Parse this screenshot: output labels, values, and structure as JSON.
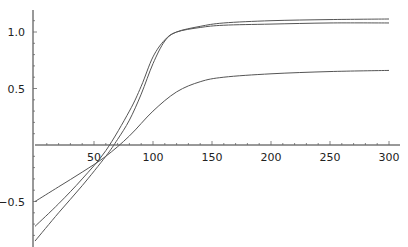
{
  "chart_data": {
    "type": "line",
    "title": "",
    "xlabel": "",
    "ylabel": "",
    "xlim": [
      0,
      300
    ],
    "ylim": [
      -0.88,
      1.18
    ],
    "grid": false,
    "legend": null,
    "x_ticks": [
      50,
      100,
      150,
      200,
      250,
      300
    ],
    "x_tick_labels": [
      "50",
      "100",
      "150",
      "200",
      "250",
      "300"
    ],
    "y_ticks": [
      -0.5,
      0.5,
      1.0
    ],
    "y_tick_labels": [
      "-0.5",
      "0.5",
      "1.0"
    ],
    "series": [
      {
        "name": "curve-1",
        "color": "#555555",
        "x": [
          0,
          20,
          40,
          60,
          80,
          90,
          100,
          110,
          120,
          140,
          160,
          200,
          250,
          300
        ],
        "y": [
          -0.72,
          -0.52,
          -0.3,
          -0.05,
          0.3,
          0.52,
          0.78,
          0.93,
          1.0,
          1.04,
          1.06,
          1.07,
          1.08,
          1.08
        ]
      },
      {
        "name": "curve-2",
        "color": "#555555",
        "x": [
          0,
          20,
          40,
          60,
          70,
          80,
          90,
          100,
          110,
          120,
          140,
          160,
          200,
          250,
          300
        ],
        "y": [
          -0.85,
          -0.6,
          -0.36,
          -0.1,
          0.05,
          0.22,
          0.45,
          0.72,
          0.92,
          1.0,
          1.05,
          1.08,
          1.1,
          1.11,
          1.115
        ]
      },
      {
        "name": "curve-3",
        "color": "#555555",
        "x": [
          0,
          20,
          40,
          60,
          80,
          100,
          120,
          140,
          160,
          200,
          250,
          300
        ],
        "y": [
          -0.5,
          -0.37,
          -0.24,
          -0.1,
          0.08,
          0.3,
          0.47,
          0.56,
          0.6,
          0.63,
          0.65,
          0.66
        ]
      }
    ]
  },
  "plot": {
    "origin_px": [
      35,
      145
    ],
    "x_scale_px_per_unit": 1.18,
    "y_scale_px_per_unit": 113
  }
}
